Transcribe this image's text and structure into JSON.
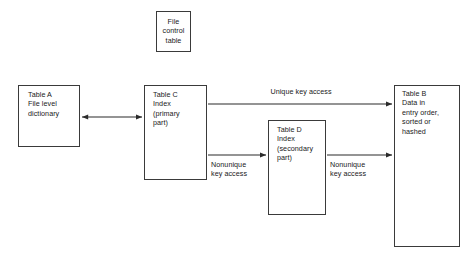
{
  "diagram": {
    "canvas": {
      "width": 473,
      "height": 260,
      "background": "#ffffff"
    },
    "stroke_color": "#3a3a3a",
    "text_color": "#1a1a1a",
    "nodes": [
      {
        "id": "file-control-table",
        "label": "File\ncontrol\ntable",
        "align": "center",
        "x": 156,
        "y": 11,
        "w": 35,
        "h": 41
      },
      {
        "id": "table-a",
        "label": "Table A\nFile level\ndictionary",
        "align": "left",
        "x": 18,
        "y": 85,
        "w": 62,
        "h": 62
      },
      {
        "id": "table-c",
        "label": "Table C\nIndex\n(primary\npart)",
        "align": "left",
        "x": 144,
        "y": 85,
        "w": 63,
        "h": 95
      },
      {
        "id": "table-d",
        "label": "Table D\nIndex\n(secondary\npart)",
        "align": "left",
        "x": 268,
        "y": 120,
        "w": 58,
        "h": 95
      },
      {
        "id": "table-b",
        "label": "Table B\nData in\nentry order,\nsorted or\nhashed",
        "align": "left",
        "x": 394,
        "y": 85,
        "w": 66,
        "h": 162
      }
    ],
    "edges": [
      {
        "id": "edge-a-c",
        "from": "table-a",
        "to": "table-c",
        "label": "",
        "arrowheads": "both",
        "x1": 81,
        "y1": 117,
        "x2": 143,
        "y2": 117
      },
      {
        "id": "edge-c-b-unique",
        "from": "table-c",
        "to": "table-b",
        "label": "Unique key access",
        "arrowheads": "end",
        "x1": 208,
        "y1": 104,
        "x2": 393,
        "y2": 104
      },
      {
        "id": "edge-c-d-nonunique",
        "from": "table-c",
        "to": "table-d",
        "label": "Nonunique\nkey access",
        "arrowheads": "end",
        "x1": 208,
        "y1": 155,
        "x2": 267,
        "y2": 155
      },
      {
        "id": "edge-d-b-nonunique",
        "from": "table-d",
        "to": "table-b",
        "label": "Nonunique\nkey access",
        "arrowheads": "end",
        "x1": 327,
        "y1": 155,
        "x2": 393,
        "y2": 155
      }
    ],
    "edge_labels": [
      {
        "id": "label-unique-key-access",
        "text": "Unique key access",
        "align": "center",
        "x": 238,
        "y": 87,
        "w": 126
      },
      {
        "id": "label-nonunique-key-access-c-d",
        "text": "Nonunique\nkey access",
        "align": "left",
        "x": 211,
        "y": 160,
        "w": 56
      },
      {
        "id": "label-nonunique-key-access-d-b",
        "text": "Nonunique\nkey access",
        "align": "left",
        "x": 330,
        "y": 160,
        "w": 56
      }
    ]
  }
}
